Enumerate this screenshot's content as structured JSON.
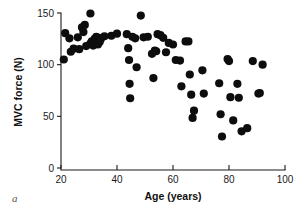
{
  "figure": {
    "panel_label": "a",
    "background_color": "#ffffff",
    "marker_color": "#0d0d0d",
    "axis_color": "#1a1a1a"
  },
  "chart_data": {
    "type": "scatter",
    "title": "",
    "subtitle": "",
    "xlabel": "Age (years)",
    "ylabel": "MVC force (N)",
    "xlim": [
      20,
      100
    ],
    "ylim": [
      0,
      150
    ],
    "xticks": [
      20,
      40,
      60,
      80,
      100
    ],
    "yticks": [
      0,
      50,
      100,
      150
    ],
    "xtick_labels": [
      "20",
      "40",
      "60",
      "80",
      "100"
    ],
    "ytick_labels": [
      "0",
      "50",
      "100",
      "150"
    ],
    "grid": false,
    "legend": null,
    "legend_position": "none",
    "annotations": [
      "a"
    ],
    "marker": "filled-circle",
    "marker_size_px": 4.1,
    "series": [
      {
        "name": "MVC force vs age",
        "points": [
          [
            21.0,
            105.0
          ],
          [
            21.5,
            130.5
          ],
          [
            23.0,
            125.5
          ],
          [
            23.5,
            112.5
          ],
          [
            24.5,
            115.5
          ],
          [
            26.0,
            126.5
          ],
          [
            26.5,
            115.0
          ],
          [
            27.5,
            136.0
          ],
          [
            28.0,
            131.5
          ],
          [
            28.5,
            138.5
          ],
          [
            29.0,
            118.0
          ],
          [
            30.5,
            149.5
          ],
          [
            30.5,
            120.5
          ],
          [
            31.0,
            122.5
          ],
          [
            31.5,
            118.5
          ],
          [
            32.0,
            125.0
          ],
          [
            32.3,
            121.0
          ],
          [
            32.6,
            127.0
          ],
          [
            33.0,
            123.5
          ],
          [
            33.2,
            119.5
          ],
          [
            33.5,
            126.0
          ],
          [
            33.8,
            122.0
          ],
          [
            34.2,
            124.5
          ],
          [
            35.5,
            127.5
          ],
          [
            38.0,
            128.0
          ],
          [
            40.0,
            130.0
          ],
          [
            43.5,
            129.5
          ],
          [
            44.0,
            116.0
          ],
          [
            44.3,
            104.5
          ],
          [
            44.5,
            81.5
          ],
          [
            44.7,
            67.5
          ],
          [
            45.5,
            127.0
          ],
          [
            46.5,
            125.5
          ],
          [
            47.0,
            97.5
          ],
          [
            48.5,
            147.5
          ],
          [
            49.5,
            126.5
          ],
          [
            51.0,
            127.0
          ],
          [
            52.5,
            110.5
          ],
          [
            53.0,
            87.0
          ],
          [
            53.5,
            113.5
          ],
          [
            54.0,
            113.0
          ],
          [
            54.5,
            129.5
          ],
          [
            55.5,
            128.5
          ],
          [
            56.5,
            126.0
          ],
          [
            57.5,
            112.0
          ],
          [
            58.5,
            121.0
          ],
          [
            60.0,
            119.5
          ],
          [
            61.0,
            104.5
          ],
          [
            62.5,
            104.0
          ],
          [
            63.0,
            79.0
          ],
          [
            64.5,
            122.5
          ],
          [
            65.5,
            122.5
          ],
          [
            66.0,
            90.5
          ],
          [
            66.5,
            71.0
          ],
          [
            67.0,
            48.5
          ],
          [
            67.5,
            55.5
          ],
          [
            70.5,
            94.5
          ],
          [
            71.0,
            72.0
          ],
          [
            76.5,
            82.0
          ],
          [
            77.0,
            52.0
          ],
          [
            77.5,
            30.5
          ],
          [
            79.5,
            105.5
          ],
          [
            80.0,
            103.5
          ],
          [
            80.5,
            68.5
          ],
          [
            81.5,
            46.0
          ],
          [
            83.0,
            81.5
          ],
          [
            83.5,
            68.0
          ],
          [
            84.5,
            35.5
          ],
          [
            86.5,
            38.5
          ],
          [
            88.5,
            103.5
          ],
          [
            90.5,
            72.0
          ],
          [
            91.0,
            72.5
          ],
          [
            92.0,
            100.0
          ]
        ]
      }
    ]
  }
}
